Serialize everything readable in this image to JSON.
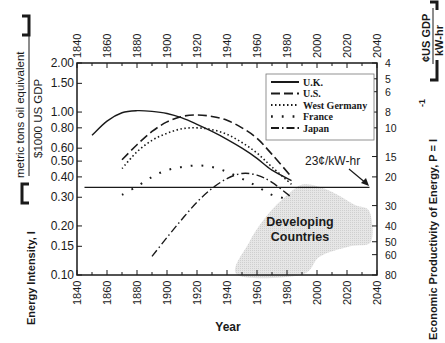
{
  "chart_data": {
    "type": "line",
    "title": "",
    "xlabel": "Year",
    "ylabel_left": {
      "main": "Energy Intensity, I",
      "unit_numerator": "metric tons oil equivalent",
      "unit_denominator": "$1000 US GDP"
    },
    "ylabel_right": {
      "main": "Economic Productivity of Energy, P = I",
      "exponent": "-1",
      "unit_numerator": "¢US GDP",
      "unit_denominator": "kW-hr"
    },
    "xlim": [
      1840,
      2040
    ],
    "ylim": [
      0.1,
      2.0
    ],
    "yscale": "log",
    "grid": false,
    "x_ticks": [
      "1840",
      "1860",
      "1880",
      "1900",
      "1920",
      "1940",
      "1960",
      "1980",
      "2000",
      "2020",
      "2040"
    ],
    "y_ticks_left": [
      {
        "value": 2.0,
        "label": "2.00"
      },
      {
        "value": 1.5,
        "label": "1.50"
      },
      {
        "value": 1.0,
        "label": "1.00"
      },
      {
        "value": 0.8,
        "label": "0.80"
      },
      {
        "value": 0.6,
        "label": "0.60"
      },
      {
        "value": 0.5,
        "label": "0.50"
      },
      {
        "value": 0.4,
        "label": "0.40"
      },
      {
        "value": 0.3,
        "label": "0.30"
      },
      {
        "value": 0.2,
        "label": "0.20"
      },
      {
        "value": 0.15,
        "label": "0.15"
      },
      {
        "value": 0.1,
        "label": "0.10"
      }
    ],
    "y_ticks_right": [
      {
        "value": 4,
        "label": "4"
      },
      {
        "value": 5,
        "label": "5"
      },
      {
        "value": 6,
        "label": "6"
      },
      {
        "value": 8,
        "label": "8"
      },
      {
        "value": 10,
        "label": "10"
      },
      {
        "value": 15,
        "label": "15"
      },
      {
        "value": 20,
        "label": "20"
      },
      {
        "value": 30,
        "label": "30"
      },
      {
        "value": 40,
        "label": "40"
      },
      {
        "value": 50,
        "label": "50"
      },
      {
        "value": 60,
        "label": "60"
      },
      {
        "value": 80,
        "label": "80"
      }
    ],
    "right_axis_conversion": "P(¢/kWh) = 8.0 / I",
    "legend_position": "top-right",
    "series": [
      {
        "name": "U.K.",
        "style": "solid",
        "x": [
          1850,
          1860,
          1870,
          1880,
          1890,
          1900,
          1910,
          1920,
          1930,
          1940,
          1950,
          1960,
          1970,
          1983
        ],
        "y": [
          0.72,
          0.88,
          0.99,
          1.02,
          1.01,
          0.98,
          0.92,
          0.84,
          0.76,
          0.68,
          0.6,
          0.52,
          0.44,
          0.38
        ]
      },
      {
        "name": "U.S.",
        "style": "dashed",
        "x": [
          1870,
          1880,
          1890,
          1900,
          1910,
          1920,
          1930,
          1940,
          1950,
          1960,
          1970,
          1983
        ],
        "y": [
          0.51,
          0.63,
          0.76,
          0.87,
          0.94,
          0.96,
          0.94,
          0.89,
          0.8,
          0.69,
          0.55,
          0.4
        ]
      },
      {
        "name": "West Germany",
        "style": "dotted",
        "x": [
          1870,
          1880,
          1890,
          1900,
          1910,
          1920,
          1930,
          1940,
          1950,
          1960,
          1970,
          1983
        ],
        "y": [
          0.45,
          0.57,
          0.67,
          0.74,
          0.79,
          0.8,
          0.78,
          0.73,
          0.65,
          0.56,
          0.46,
          0.36
        ]
      },
      {
        "name": "France",
        "style": "sparse-dots",
        "x": [
          1870,
          1880,
          1890,
          1900,
          1910,
          1920,
          1930,
          1940,
          1950,
          1960,
          1970,
          1983
        ],
        "y": [
          0.31,
          0.35,
          0.4,
          0.44,
          0.46,
          0.47,
          0.46,
          0.43,
          0.39,
          0.35,
          0.31,
          0.29
        ]
      },
      {
        "name": "Japan",
        "style": "dash-dot",
        "x": [
          1890,
          1900,
          1910,
          1920,
          1930,
          1940,
          1950,
          1960,
          1970,
          1983
        ],
        "y": [
          0.13,
          0.17,
          0.22,
          0.28,
          0.34,
          0.39,
          0.42,
          0.41,
          0.37,
          0.3
        ]
      }
    ],
    "reference_line": {
      "label": "23¢/kW-hr",
      "value": 0.345,
      "x": [
        1845,
        2035
      ]
    },
    "shaded_region": {
      "label_line1": "Developing",
      "label_line2": "Countries",
      "polygon": [
        [
          1947,
          0.1
        ],
        [
          1955,
          0.16
        ],
        [
          1968,
          0.24
        ],
        [
          1982,
          0.32
        ],
        [
          1992,
          0.36
        ],
        [
          2008,
          0.33
        ],
        [
          2025,
          0.27
        ],
        [
          2035,
          0.245
        ],
        [
          2036,
          0.16
        ],
        [
          2022,
          0.15
        ],
        [
          2002,
          0.13
        ],
        [
          1989,
          0.1
        ]
      ]
    }
  }
}
